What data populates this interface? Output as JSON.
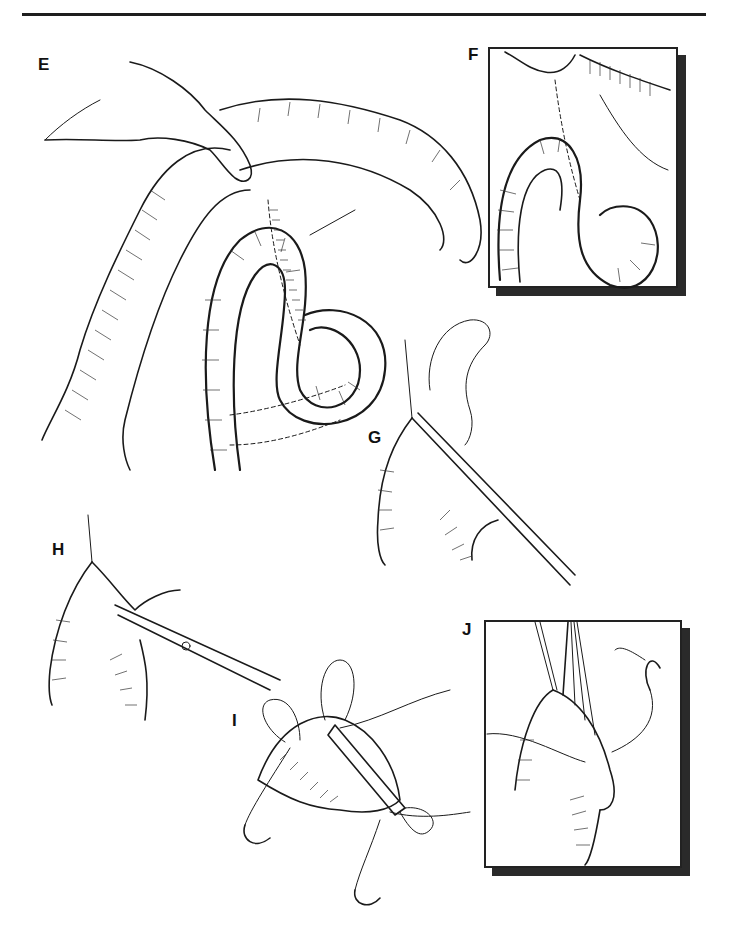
{
  "page": {
    "type": "surgical illustration plate",
    "background": "#ffffff",
    "rule_color": "#1e1e1e"
  },
  "figure": {
    "panels": [
      {
        "id": "E",
        "label": "E",
        "description": "Hand retracting colon; bowel loop with anastomosis sutured to mesentery"
      },
      {
        "id": "F",
        "label": "F",
        "description": "Boxed inset: close-up of sutured bowel loop",
        "boxed": true
      },
      {
        "id": "G",
        "label": "G",
        "description": "Clamp applied along bowel edge with suture"
      },
      {
        "id": "H",
        "label": "H",
        "description": "Scissors excising strip of bowel edge"
      },
      {
        "id": "I",
        "label": "I",
        "description": "Bowel end with stay sutures and needles"
      },
      {
        "id": "J",
        "label": "J",
        "description": "Boxed inset: sutures tied and closure of bowel end",
        "boxed": true
      }
    ]
  }
}
